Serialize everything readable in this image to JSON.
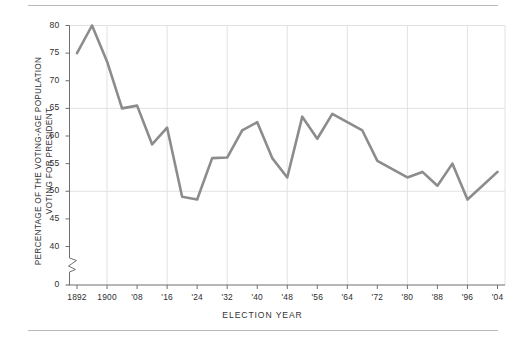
{
  "chart_data": {
    "type": "line",
    "title": "",
    "xlabel": "ELECTION YEAR",
    "ylabel": "PERCENTAGE OF THE VOTING-AGE POPULATION\nVOTING FOR PRESIDENT",
    "x": [
      1892,
      1896,
      1900,
      1904,
      1908,
      1912,
      1916,
      1920,
      1924,
      1928,
      1932,
      1936,
      1940,
      1944,
      1948,
      1952,
      1956,
      1960,
      1964,
      1968,
      1972,
      1976,
      1980,
      1984,
      1988,
      1992,
      1996,
      2000,
      2004
    ],
    "values": [
      75.0,
      80.0,
      73.5,
      65.0,
      65.5,
      58.5,
      61.5,
      49.0,
      48.5,
      56.0,
      56.1,
      61.0,
      62.5,
      56.0,
      52.5,
      63.5,
      59.5,
      64.0,
      62.5,
      61.0,
      55.5,
      54.0,
      52.5,
      53.5,
      51.0,
      55.0,
      48.5,
      51.0,
      53.5
    ],
    "series_name": "Voter turnout",
    "line_color": "#8c8c8c",
    "line_width": 2.6,
    "grid": true,
    "grid_color": "#e2e2e4",
    "legend": "none",
    "xlim": [
      1890,
      2006
    ],
    "ylim": [
      38.5,
      81.5
    ],
    "y_axis_break": true,
    "y_break_between": [
      0,
      40
    ],
    "yticks": [
      0,
      40,
      45,
      50,
      55,
      60,
      65,
      70,
      75,
      80
    ],
    "ygridlines": [
      50,
      65,
      80
    ],
    "xticks": [
      1892,
      1900,
      1908,
      1916,
      1924,
      1932,
      1940,
      1948,
      1956,
      1964,
      1972,
      1980,
      1988,
      1996,
      2004
    ],
    "xtick_labels": [
      "1892",
      "1900",
      "'08",
      "'16",
      "'24",
      "'32",
      "'40",
      "'48",
      "'56",
      "'64",
      "'72",
      "'80",
      "'88",
      "'96",
      "'04"
    ],
    "xgridlines": [
      1900,
      1916,
      1932,
      1948,
      1964,
      1980,
      1996
    ],
    "ytick_labels": [
      "0",
      "40",
      "45",
      "50",
      "55",
      "60",
      "65",
      "70",
      "75",
      "80"
    ],
    "axis_color": "#6f6f72",
    "rule_color": "#b9b9bb"
  }
}
